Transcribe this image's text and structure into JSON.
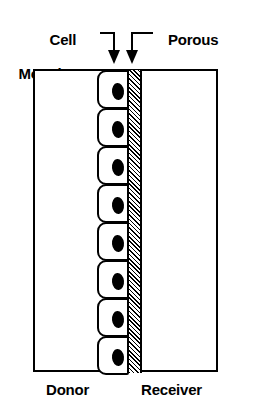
{
  "figure": {
    "type": "diagram",
    "callouts": {
      "cell_monolayer": {
        "line1": "Cell",
        "line2": "Monolayer",
        "pointer": "down-arrow"
      },
      "porous_support": {
        "line1": "Porous",
        "line2": "Support",
        "pointer": "down-arrow"
      }
    },
    "compartments": {
      "left_label": "Donor",
      "right_label": "Receiver"
    },
    "monolayer": {
      "cell_count": 8,
      "cells": [
        {
          "index": 1
        },
        {
          "index": 2
        },
        {
          "index": 3
        },
        {
          "index": 4
        },
        {
          "index": 5
        },
        {
          "index": 6
        },
        {
          "index": 7
        },
        {
          "index": 8
        }
      ]
    },
    "colors": {
      "ink": "#000000",
      "paper": "#ffffff",
      "membrane_hatch": "#000000"
    }
  }
}
